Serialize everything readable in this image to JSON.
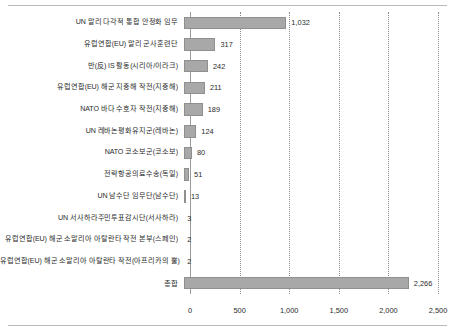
{
  "chart_data": {
    "type": "bar",
    "orientation": "horizontal",
    "title": "",
    "xlabel": "",
    "ylabel": "",
    "xlim": [
      0,
      2500
    ],
    "xticks": [
      "0",
      "500",
      "1,000",
      "1,500",
      "2,000",
      "2,500"
    ],
    "xtick_values": [
      0,
      500,
      1000,
      1500,
      2000,
      2500
    ],
    "grid": "vertical-dotted",
    "legend": "none",
    "bar_color": "#a8a8a8",
    "bar_edge_color": "#8f8f8f",
    "categories": [
      "UN 말리 다각적 통합 안정화 임무",
      "유럽연합(EU) 말리 군사훈련단",
      "반(反) IS 활동(시리아/이라크)",
      "유럽연합(EU) 해군 지중해 작전(지중해)",
      "NATO 바다 수호자 작전(지중해)",
      "UN 레바논평화유지군(레바논)",
      "NATO 코소보군(코소보)",
      "전략항공의료수송(독일)",
      "UN 남수단 임무단(남수단)",
      "UN 서사하라주민투표감시단(서사하라)",
      "유럽연합(EU) 해군 소말리아 아탈란타 작전 본부(스페인)",
      "유럽연합(EU) 해군 소말리아 아탈란타 작전(아프리카의 뿔)",
      "총합"
    ],
    "values": [
      1032,
      317,
      242,
      211,
      189,
      124,
      80,
      51,
      13,
      3,
      2,
      2,
      2266
    ],
    "value_labels": [
      "1,032",
      "317",
      "242",
      "211",
      "189",
      "124",
      "80",
      "51",
      "13",
      "3",
      "2",
      "2",
      "2,266"
    ]
  }
}
